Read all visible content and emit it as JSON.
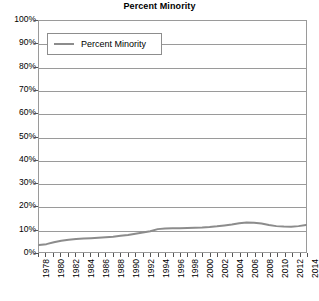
{
  "chart_data": {
    "type": "line",
    "title": "Percent Minority",
    "xlabel": "",
    "ylabel": "",
    "ylim": [
      0,
      100
    ],
    "ytick_labels": [
      "100%",
      "90%",
      "80%",
      "70%",
      "60%",
      "50%",
      "40%",
      "30%",
      "20%",
      "10%",
      "0%"
    ],
    "ytick_values": [
      100,
      90,
      80,
      70,
      60,
      50,
      40,
      30,
      20,
      10,
      0
    ],
    "grid": true,
    "legend_position": "top-left",
    "legend_entries": [
      "Percent Minority"
    ],
    "x": [
      1978,
      1979,
      1980,
      1981,
      1982,
      1983,
      1984,
      1985,
      1986,
      1987,
      1988,
      1989,
      1990,
      1991,
      1992,
      1993,
      1994,
      1995,
      1996,
      1997,
      1998,
      1999,
      2000,
      2001,
      2002,
      2003,
      2004,
      2005,
      2006,
      2007,
      2008,
      2009,
      2010,
      2011,
      2012,
      2013,
      2014
    ],
    "xtick_labels": [
      "1978",
      "",
      "1980",
      "",
      "1982",
      "",
      "1984",
      "",
      "1986",
      "",
      "1988",
      "",
      "1990",
      "",
      "1992",
      "",
      "1994",
      "",
      "1996",
      "",
      "1998",
      "",
      "2000",
      "",
      "2002",
      "",
      "2004",
      "",
      "2006",
      "",
      "2008",
      "",
      "2010",
      "",
      "2012",
      "",
      "2014"
    ],
    "series": [
      {
        "name": "Percent Minority",
        "color": "#8c8c8c",
        "values": [
          3.0,
          3.4,
          4.2,
          4.9,
          5.3,
          5.6,
          5.8,
          6.0,
          6.2,
          6.4,
          6.6,
          7.0,
          7.4,
          7.9,
          8.4,
          9.0,
          9.9,
          10.2,
          10.3,
          10.3,
          10.4,
          10.5,
          10.6,
          10.8,
          11.1,
          11.5,
          11.9,
          12.4,
          12.8,
          12.7,
          12.3,
          11.7,
          11.2,
          11.0,
          10.9,
          11.2,
          11.7
        ]
      }
    ]
  },
  "colors": {
    "series_line": "#8c8c8c",
    "grid": "#9a9a9a",
    "axis": "#7a7a7a",
    "text": "#000000"
  }
}
